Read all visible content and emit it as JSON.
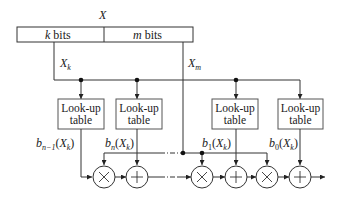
{
  "diagram": {
    "input_label": "X",
    "register": {
      "left_field": {
        "var": "k",
        "text": " bits"
      },
      "right_field": {
        "var": "m",
        "text": " bits"
      }
    },
    "signals": {
      "xk": {
        "base": "X",
        "sub": "k"
      },
      "xm": {
        "base": "X",
        "sub": "m"
      }
    },
    "lookup_tables": [
      {
        "line1": "Look-up",
        "line2": "table",
        "output": {
          "b_sub": "n−1",
          "arg_base": "X",
          "arg_sub": "k"
        }
      },
      {
        "line1": "Look-up",
        "line2": "table",
        "output": {
          "b_sub": "n",
          "arg_base": "X",
          "arg_sub": "k"
        }
      },
      {
        "line1": "Look-up",
        "line2": "table",
        "output": {
          "b_sub": "1",
          "arg_base": "X",
          "arg_sub": "k"
        }
      },
      {
        "line1": "Look-up",
        "line2": "table",
        "output": {
          "b_sub": "0",
          "arg_base": "X",
          "arg_sub": "k"
        }
      }
    ],
    "operators": [
      {
        "type": "multiply",
        "symbol": "×"
      },
      {
        "type": "add",
        "symbol": "+"
      },
      {
        "type": "multiply",
        "symbol": "×"
      },
      {
        "type": "add",
        "symbol": "+"
      },
      {
        "type": "multiply",
        "symbol": "×"
      },
      {
        "type": "add",
        "symbol": "+"
      }
    ],
    "colors": {
      "line": "#333333",
      "box_border": "#555555"
    }
  }
}
